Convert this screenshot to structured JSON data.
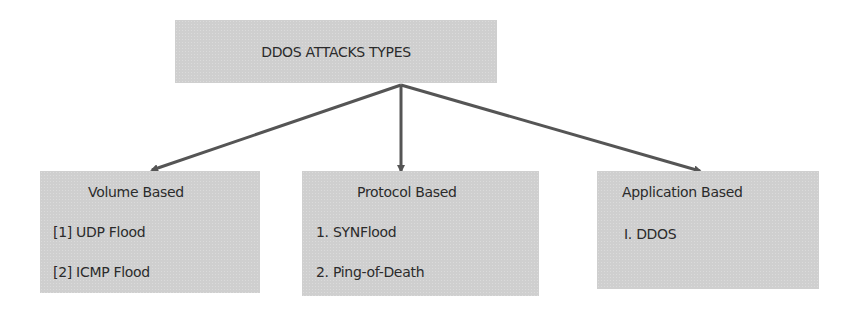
{
  "diagram": {
    "root": {
      "label": "DDOS ATTACKS TYPES"
    },
    "children": [
      {
        "title": "Volume Based",
        "items": [
          "[1] UDP Flood",
          "[2] ICMP Flood"
        ]
      },
      {
        "title": "Protocol Based",
        "items": [
          "1. SYNFlood",
          "2. Ping-of-Death"
        ]
      },
      {
        "title": "Application Based",
        "items": [
          "I. DDOS"
        ]
      }
    ],
    "colors": {
      "box_fill": "#cfcfcf",
      "arrow": "#555555",
      "text": "#2b2b2b"
    }
  }
}
